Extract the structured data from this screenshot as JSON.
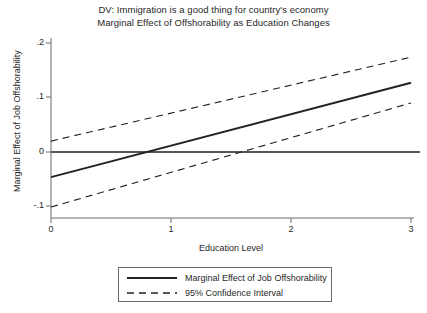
{
  "title": {
    "line1": "DV: Immigration is a good thing for country's economy",
    "line2": "Marginal Effect of Offshorability as Education Changes"
  },
  "axes": {
    "xlabel": "Education Level",
    "ylabel": "Marginal Effect of Job Offshorability",
    "xticks": [
      "0",
      "1",
      "2",
      "3"
    ],
    "yticks": [
      ".2",
      ".1",
      "0",
      "-.1"
    ]
  },
  "legend": {
    "items": [
      {
        "label": "Marginal Effect of Job Offshorability",
        "style": "solid"
      },
      {
        "label": "95% Confidence Interval",
        "style": "dashed"
      }
    ]
  },
  "colors": {
    "line": "#222222",
    "axis": "#6b6b6b",
    "zero_line": "#555555",
    "text": "#1f1f1f",
    "background": "#ffffff"
  },
  "chart_data": {
    "type": "line",
    "xlabel": "Education Level",
    "ylabel": "Marginal Effect of Job Offshorability",
    "xlim": [
      0,
      3
    ],
    "ylim": [
      -0.12,
      0.21
    ],
    "xticks": [
      0,
      1,
      2,
      3
    ],
    "yticks": [
      -0.1,
      0,
      0.1,
      0.2
    ],
    "grid": false,
    "legend_position": "bottom-center",
    "zero_reference_line": 0,
    "series": [
      {
        "name": "Marginal Effect of Job Offshorability",
        "style": "solid",
        "x": [
          0,
          3
        ],
        "values": [
          -0.046,
          0.127
        ]
      },
      {
        "name": "95% Confidence Interval (upper)",
        "style": "dashed",
        "x": [
          0,
          3
        ],
        "values": [
          0.02,
          0.174
        ]
      },
      {
        "name": "95% Confidence Interval (lower)",
        "style": "dashed",
        "x": [
          0,
          3
        ],
        "values": [
          -0.101,
          0.09
        ]
      }
    ]
  }
}
